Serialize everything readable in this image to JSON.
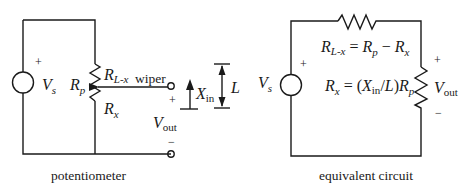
{
  "left_circuit": {
    "caption": "potentiometer",
    "source": {
      "label": "V",
      "sub": "s",
      "polarity": "+"
    },
    "resistor": {
      "label": "R",
      "sub": "p"
    },
    "upper_segment": {
      "label": "R",
      "sub": "L-x"
    },
    "lower_segment": {
      "label": "R",
      "sub": "x"
    },
    "wiper_label": "wiper",
    "output": {
      "label": "V",
      "sub": "out",
      "plus": "+",
      "minus": "−"
    },
    "displacement": {
      "label": "X",
      "sub": "in"
    },
    "length": {
      "label": "L"
    }
  },
  "right_circuit": {
    "caption": "equivalent circuit",
    "source": {
      "label": "V",
      "sub": "s",
      "polarity": "+"
    },
    "eq1": {
      "lhs": "R",
      "lhs_sub": "L-x",
      "eq": " = ",
      "r1": "R",
      "r1_sub": "p",
      "minus": " − ",
      "r2": "R",
      "r2_sub": "x"
    },
    "eq2": {
      "lhs": "R",
      "lhs_sub": "x",
      "eq": " = (",
      "x": "X",
      "x_sub": "in",
      "div": "/",
      "l": "L",
      "close": ")",
      "r": "R",
      "r_sub": "p"
    },
    "output": {
      "label": "V",
      "sub": "out",
      "plus": "+",
      "minus": "−"
    }
  }
}
